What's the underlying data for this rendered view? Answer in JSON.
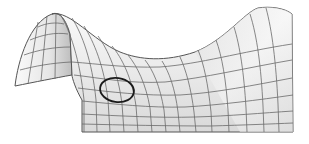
{
  "figure": {
    "marker": {
      "shape": "ellipse",
      "description": "circled point on the saddle surface",
      "cx": 117,
      "cy": 90,
      "rx": 17,
      "ry": 12,
      "stroke": "#1a1a1a"
    },
    "colors": {
      "surface_light": "#f7f7f7",
      "surface_shade": "#d4d4d4",
      "grid": "#6a6a6a",
      "background": "#ffffff"
    }
  }
}
